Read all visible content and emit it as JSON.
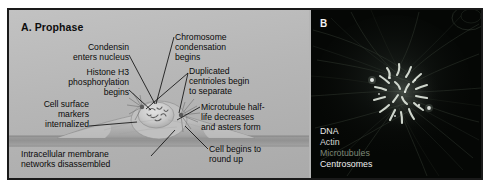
{
  "figure": {
    "panel_a": {
      "title": "A. Prophase",
      "labels": {
        "condensin": "Condensin\nenters nucleus",
        "histone": "Histone H3\nphosphorylation\nbegins",
        "cell_surface": "Cell surface\nmarkers\ninternalized",
        "intracellular": "Intracellular membrane\nnetworks disassembled",
        "chromosome": "Chromosome\ncondensation\nbegins",
        "centrioles": "Duplicated\ncentrioles begin\nto separate",
        "microtubule": "Microtubule half-\nlife decreases\nand asters form",
        "round_up": "Cell begins to\nround up"
      }
    },
    "panel_b": {
      "title": "B",
      "legend": [
        {
          "label": "DNA",
          "color": "#e8e8e8"
        },
        {
          "label": "Actin",
          "color": "#d8d8d8"
        },
        {
          "label": "Microtubules",
          "color": "#7e8878"
        },
        {
          "label": "Centrosomes",
          "color": "#f0f0f0"
        }
      ]
    },
    "colors": {
      "panel_a_background": "#b5b5b5",
      "panel_b_background": "#050505",
      "border": "#1a1a1a",
      "text": "#0a0a0a"
    }
  }
}
